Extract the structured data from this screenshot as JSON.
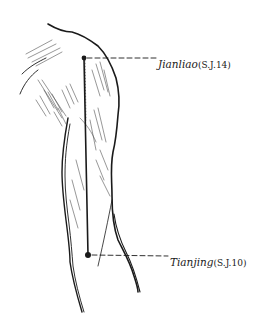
{
  "diagram": {
    "points": [
      {
        "name": "Jianliao",
        "code": "(S.J.14)",
        "x": 84,
        "y": 58
      },
      {
        "name": "Tianjing",
        "code": "(S.J.10)",
        "x": 88,
        "y": 255
      }
    ],
    "colors": {
      "ink": "#1a1a1a",
      "background": "#ffffff"
    }
  }
}
